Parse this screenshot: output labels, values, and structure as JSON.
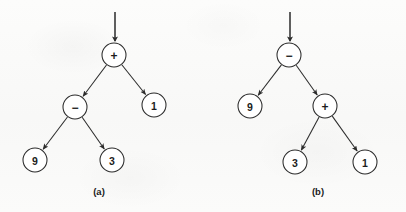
{
  "figure": {
    "background_color": "#fbfbfa",
    "stroke_color": "#2b2b2b",
    "node_fill_color": "#ffffff",
    "text_color": "#1c1c1c"
  },
  "chart_data": {
    "type": "diagram",
    "title": "",
    "subtitle": "",
    "xlabel": "",
    "ylabel": "",
    "diagram_kind": "binary-expression-tree",
    "panels": [
      {
        "id": "a",
        "caption": "(a)",
        "caption_x": 99,
        "caption_y": 191,
        "expression": "9 - 3 + 1",
        "entry_arrow": {
          "x": 115,
          "y_start": 12,
          "y_end": 41
        },
        "nodes": [
          {
            "id": "a-root",
            "label": "+",
            "kind": "operator",
            "cx": 114,
            "cy": 55,
            "r": 12
          },
          {
            "id": "a-minus",
            "label": "−",
            "kind": "operator",
            "cx": 75,
            "cy": 107,
            "r": 12
          },
          {
            "id": "a-one",
            "label": "1",
            "kind": "operand",
            "cx": 154,
            "cy": 105,
            "r": 12
          },
          {
            "id": "a-nine",
            "label": "9",
            "kind": "operand",
            "cx": 35,
            "cy": 160,
            "r": 12
          },
          {
            "id": "a-three",
            "label": "3",
            "kind": "operand",
            "cx": 112,
            "cy": 160,
            "r": 12
          }
        ],
        "edges": [
          {
            "from": "a-root",
            "to": "a-minus"
          },
          {
            "from": "a-root",
            "to": "a-one"
          },
          {
            "from": "a-minus",
            "to": "a-nine"
          },
          {
            "from": "a-minus",
            "to": "a-three"
          }
        ]
      },
      {
        "id": "b",
        "caption": "(b)",
        "caption_x": 318,
        "caption_y": 191,
        "expression": "9 - (3 + 1)",
        "entry_arrow": {
          "x": 290,
          "y_start": 12,
          "y_end": 41
        },
        "nodes": [
          {
            "id": "b-root",
            "label": "−",
            "kind": "operator",
            "cx": 289,
            "cy": 55,
            "r": 12
          },
          {
            "id": "b-nine",
            "label": "9",
            "kind": "operand",
            "cx": 250,
            "cy": 106,
            "r": 12
          },
          {
            "id": "b-plus",
            "label": "+",
            "kind": "operator",
            "cx": 325,
            "cy": 106,
            "r": 12
          },
          {
            "id": "b-three",
            "label": "3",
            "kind": "operand",
            "cx": 295,
            "cy": 162,
            "r": 12
          },
          {
            "id": "b-one",
            "label": "1",
            "kind": "operand",
            "cx": 365,
            "cy": 162,
            "r": 12
          }
        ],
        "edges": [
          {
            "from": "b-root",
            "to": "b-nine"
          },
          {
            "from": "b-root",
            "to": "b-plus"
          },
          {
            "from": "b-plus",
            "to": "b-three"
          },
          {
            "from": "b-plus",
            "to": "b-one"
          }
        ]
      }
    ]
  }
}
